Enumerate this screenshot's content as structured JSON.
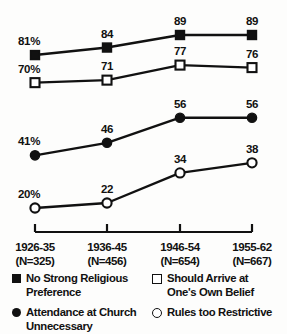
{
  "chart_data": {
    "type": "line",
    "title": "",
    "xlabel": "",
    "ylabel": "",
    "ylim": [
      0,
      100
    ],
    "grid": false,
    "legend_position": "bottom",
    "categories": [
      "1926-35",
      "1936-45",
      "1946-54",
      "1955-62"
    ],
    "category_counts": [
      "(N=325)",
      "(N=456)",
      "(N=654)",
      "(N=667)"
    ],
    "series": [
      {
        "name": "No Strong Religious Preference",
        "marker": "filled-square",
        "values": [
          81,
          84,
          89,
          89
        ],
        "labels": [
          "81%",
          "84",
          "89",
          "89"
        ]
      },
      {
        "name": "Should Arrive at One's Own Belief",
        "marker": "open-square",
        "values": [
          70,
          71,
          77,
          76
        ],
        "labels": [
          "70%",
          "71",
          "77",
          "76"
        ]
      },
      {
        "name": "Attendance at Church Unnecessary",
        "marker": "filled-circle",
        "values": [
          41,
          46,
          56,
          56
        ],
        "labels": [
          "41%",
          "46",
          "56",
          "56"
        ]
      },
      {
        "name": "Rules too Restrictive",
        "marker": "open-circle",
        "values": [
          20,
          22,
          34,
          38
        ],
        "labels": [
          "20%",
          "22",
          "34",
          "38"
        ]
      }
    ]
  },
  "legend": {
    "items": [
      {
        "marker": "filled-square",
        "line1": "No Strong Religious",
        "line2": "Preference"
      },
      {
        "marker": "open-square",
        "line1": "Should Arrive at",
        "line2": "One's Own Belief"
      },
      {
        "marker": "filled-circle",
        "line1": "Attendance at Church",
        "line2": "Unnecessary"
      },
      {
        "marker": "open-circle",
        "line1": "Rules too Restrictive",
        "line2": ""
      }
    ]
  },
  "style": {
    "ink": "#111111",
    "background": "#fdfdfc"
  }
}
